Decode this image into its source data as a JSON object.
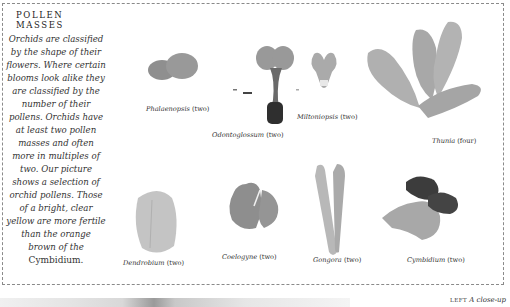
{
  "panel": {
    "title": "POLLEN MASSES",
    "text_italic": "Orchids are classified by the shape of their flowers. Where certain blooms look alike they are classified by the number of their pollens. Orchids have at least two pollen masses and often more in multiples of two. Our picture shows a selection of orchid pollens. Those of a bright, clear yellow are more fertile than the orange brown of the",
    "text_roman_end": "Cymbidium."
  },
  "specimens": [
    {
      "name": "Phalaenopsis",
      "count": "(two)"
    },
    {
      "name": "Odontoglossum",
      "count": "(two)"
    },
    {
      "name": "Miltoniopsis",
      "count": "(two)"
    },
    {
      "name": "Thunia",
      "count": "(four)"
    },
    {
      "name": "Dendrobium",
      "count": "(two)"
    },
    {
      "name": "Coelogyne",
      "count": "(two)"
    },
    {
      "name": "Gongora",
      "count": "(two)"
    },
    {
      "name": "Cymbidium",
      "count": "(two)"
    }
  ],
  "footer": {
    "caption_label": "LEFT",
    "caption_text": "A close-up"
  },
  "colors": {
    "border": "#8a8a8a",
    "pollen_light": "#b5b5b5",
    "pollen_mid": "#8c8c8c",
    "pollen_dark": "#3a3a3a"
  }
}
